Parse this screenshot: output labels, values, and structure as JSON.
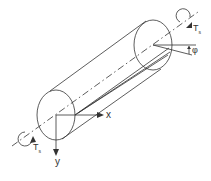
{
  "diagram": {
    "title": "",
    "colors": {
      "stroke": "#333333",
      "background": "#ffffff"
    },
    "labels": {
      "x_axis": "x",
      "y_axis": "y",
      "twist_angle": "φ",
      "torque_top": {
        "main": "T",
        "sub": "s"
      },
      "torque_bottom": {
        "main": "T",
        "sub": "s"
      }
    },
    "elements": [
      "front-end-ellipse",
      "back-end-ellipse",
      "cylinder-top-edge",
      "cylinder-bottom-edge",
      "centerline-dash-dot",
      "generator-line-original",
      "generator-line-twisted",
      "x-axis-arrow",
      "y-axis-arrow",
      "twist-angle-marker",
      "torque-arrow-top",
      "torque-arrow-bottom"
    ]
  }
}
